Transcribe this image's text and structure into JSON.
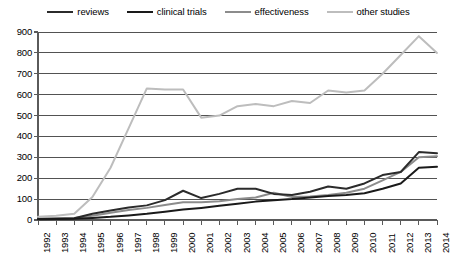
{
  "chart_data": {
    "type": "line",
    "title": "",
    "xlabel": "",
    "ylabel": "",
    "grid": true,
    "legend_position": "top-center",
    "ylim": [
      0,
      900
    ],
    "yticks": [
      0,
      100,
      200,
      300,
      400,
      500,
      600,
      700,
      800,
      900
    ],
    "categories": [
      "1992",
      "1993",
      "1994",
      "1995",
      "1996",
      "1997",
      "1998",
      "1999",
      "2000",
      "2001",
      "2002",
      "2003",
      "2004",
      "2005",
      "2006",
      "2007",
      "2008",
      "2009",
      "2010",
      "2011",
      "2012",
      "2013",
      "2014"
    ],
    "series": [
      {
        "name": "reviews",
        "color": "#2b2b2b",
        "width": 2.0,
        "values": [
          5,
          6,
          8,
          30,
          45,
          60,
          70,
          95,
          140,
          105,
          125,
          150,
          150,
          125,
          120,
          135,
          160,
          150,
          175,
          215,
          230,
          325,
          320
        ]
      },
      {
        "name": "clinical trials",
        "color": "#1a1a1a",
        "width": 2.0,
        "values": [
          4,
          5,
          6,
          10,
          15,
          22,
          30,
          40,
          50,
          58,
          68,
          78,
          88,
          95,
          100,
          108,
          115,
          120,
          128,
          150,
          175,
          250,
          255
        ]
      },
      {
        "name": "effectiveness",
        "color": "#8c8c8c",
        "width": 2.0,
        "values": [
          6,
          8,
          10,
          20,
          35,
          48,
          58,
          72,
          85,
          85,
          90,
          100,
          108,
          130,
          110,
          112,
          120,
          130,
          150,
          190,
          230,
          300,
          305
        ]
      },
      {
        "name": "other studies",
        "color": "#bdbdbd",
        "width": 2.0,
        "values": [
          15,
          20,
          30,
          110,
          250,
          440,
          630,
          625,
          625,
          490,
          500,
          545,
          555,
          545,
          570,
          560,
          620,
          610,
          620,
          700,
          790,
          880,
          800
        ]
      }
    ]
  },
  "legend": {
    "items": [
      {
        "label": "reviews",
        "color": "#2b2b2b",
        "width": 2.2
      },
      {
        "label": "clinical trials",
        "color": "#1a1a1a",
        "width": 2.2
      },
      {
        "label": "effectiveness",
        "color": "#8c8c8c",
        "width": 2.2
      },
      {
        "label": "other studies",
        "color": "#bdbdbd",
        "width": 2.2
      }
    ]
  },
  "axes": {
    "y_labels": [
      "900",
      "800",
      "700",
      "600",
      "500",
      "400",
      "300",
      "200",
      "100",
      "0"
    ],
    "x_labels": [
      "1992",
      "1993",
      "1994",
      "1995",
      "1996",
      "1997",
      "1998",
      "1999",
      "2000",
      "2001",
      "2002",
      "2003",
      "2004",
      "2005",
      "2006",
      "2007",
      "2008",
      "2009",
      "2010",
      "2011",
      "2012",
      "2013",
      "2014"
    ]
  },
  "style": {
    "grid_color": "#3f3f3f",
    "axis_color": "#5a5a5a",
    "background": "#ffffff"
  }
}
